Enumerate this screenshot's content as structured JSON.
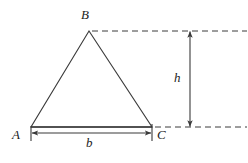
{
  "figure": {
    "type": "geometry-diagram",
    "background_color": "#ffffff",
    "stroke_color": "#3a3a3a",
    "label_color": "#1b1b1b",
    "canvas": {
      "width": 248,
      "height": 163
    },
    "labels": {
      "apex": "B",
      "bottom_left": "A",
      "bottom_right": "C",
      "height": "h",
      "base": "b"
    },
    "geometry": {
      "triangle": {
        "apex": {
          "x": 89,
          "y": 31
        },
        "bottom_left": {
          "x": 31,
          "y": 127
        },
        "bottom_right": {
          "x": 152,
          "y": 127
        }
      },
      "base_dimension": {
        "from_x": 31,
        "to_x": 152,
        "y": 133,
        "extension_tick_top": 126,
        "extension_tick_bottom": 141
      },
      "height_dimension": {
        "x": 190,
        "from_y": 31,
        "to_y": 127
      },
      "dashed_guide_top": {
        "from_x": 92,
        "to_x": 247,
        "y": 31
      },
      "dashed_guide_bottom": {
        "from_x": 155,
        "to_x": 247,
        "y": 127
      }
    }
  }
}
